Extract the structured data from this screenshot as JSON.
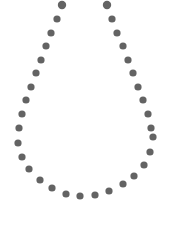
{
  "figure": {
    "dot_color": "#636363",
    "background_color": "#ffffff",
    "dot_count": 34
  }
}
